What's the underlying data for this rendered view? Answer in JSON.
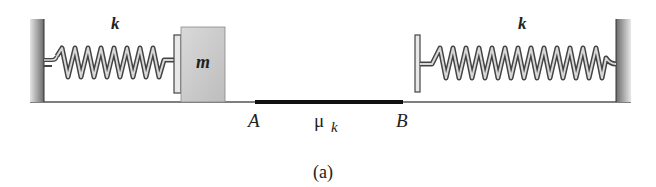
{
  "diagram": {
    "caption": "(a)",
    "left_spring": {
      "label": "k"
    },
    "right_spring": {
      "label": "k"
    },
    "block": {
      "label": "m"
    },
    "rough_region": {
      "start_label": "A",
      "end_label": "B",
      "friction_symbol": "μ",
      "friction_subscript": "k"
    },
    "colors": {
      "wall": "#9a9a9a",
      "block": "#cfcfcf",
      "floor": "#555555",
      "rough_segment": "#111111",
      "spring_dark": "#444444",
      "spring_light": "#d8d8d8"
    }
  }
}
